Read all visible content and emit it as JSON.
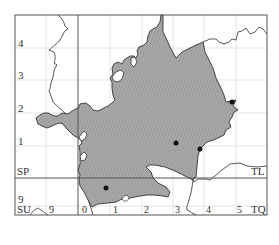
{
  "map": {
    "type": "distribution-grid-map",
    "colors": {
      "frame": "#555555",
      "major_line": "#555555",
      "grid": "#dddddd",
      "fill": "#a8a8a8",
      "hatch": "#8c8c8c",
      "outline": "#333333",
      "border_line": "#444444",
      "dot": "#111111"
    },
    "grid_squares": {
      "top_left": "SP",
      "top_right": "TL",
      "bottom_left": "SU",
      "bottom_right": "TQ"
    },
    "left_axis_labels": [
      "4",
      "3",
      "2",
      "1",
      "9"
    ],
    "bottom_axis_labels": [
      "9",
      "0",
      "1",
      "2",
      "3",
      "4",
      "5"
    ],
    "points": [
      {
        "name": "record-1",
        "x": 106,
        "y": 188
      },
      {
        "name": "record-2",
        "x": 176,
        "y": 143
      },
      {
        "name": "record-3",
        "x": 200,
        "y": 149
      },
      {
        "name": "record-4",
        "x": 232,
        "y": 102
      }
    ]
  }
}
